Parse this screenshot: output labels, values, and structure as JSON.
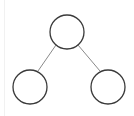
{
  "diagram": {
    "type": "binary-tree",
    "stroke_color": "#3a3a3a",
    "edge_color": "#8a8a8a",
    "background": "#ffffff",
    "nodes": [
      {
        "id": "root",
        "label": "",
        "cx": 67,
        "cy": 32,
        "r": 17
      },
      {
        "id": "left-child",
        "label": "",
        "cx": 30,
        "cy": 87,
        "r": 17
      },
      {
        "id": "right-child",
        "label": "",
        "cx": 108,
        "cy": 87,
        "r": 17
      }
    ],
    "edges": [
      {
        "from": "root",
        "to": "left-child",
        "x1": 56,
        "y1": 45,
        "x2": 38,
        "y2": 71
      },
      {
        "from": "root",
        "to": "right-child",
        "x1": 78,
        "y1": 45,
        "x2": 100,
        "y2": 71
      }
    ]
  }
}
